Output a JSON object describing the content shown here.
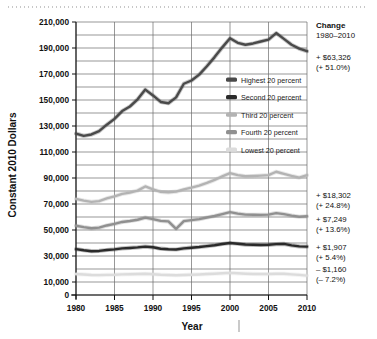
{
  "chart_data": {
    "type": "line",
    "title": "",
    "xlabel": "Year",
    "ylabel": "Constant 2010 Dollars",
    "xlim": [
      1980,
      2010
    ],
    "ylim": [
      0,
      210000
    ],
    "grid": true,
    "ytick_step": 20000,
    "ygrid_step": 10000,
    "xtick_step": 5,
    "legend_position": "inside-right-upper",
    "xticklabels": [
      "1980",
      "1985",
      "1990",
      "1995",
      "2000",
      "2005",
      "2010"
    ],
    "yticklabels": [
      "0",
      "10,000",
      "30,000",
      "50,000",
      "70,000",
      "90,000",
      "110,000",
      "130,000",
      "150,000",
      "170,000",
      "190,000",
      "210,000"
    ],
    "x": [
      1980,
      1981,
      1982,
      1983,
      1984,
      1985,
      1986,
      1987,
      1988,
      1989,
      1990,
      1991,
      1992,
      1993,
      1994,
      1995,
      1996,
      1997,
      1998,
      1999,
      2000,
      2001,
      2002,
      2003,
      2004,
      2005,
      2006,
      2007,
      2008,
      2009,
      2010
    ],
    "series": [
      {
        "name": "Highest 20 percent",
        "color": "#4a4a4a",
        "values": [
          124200,
          122400,
          123500,
          126000,
          131000,
          135500,
          141500,
          145000,
          150500,
          158000,
          153500,
          148500,
          147500,
          152000,
          162500,
          165000,
          169500,
          176000,
          183000,
          190500,
          197500,
          194000,
          192500,
          193500,
          195000,
          196500,
          201500,
          197000,
          192500,
          189500,
          187526
        ]
      },
      {
        "name": "Second 20 percent",
        "color": "#2a2a2a",
        "values": [
          35300,
          34400,
          33700,
          33900,
          34600,
          35100,
          35900,
          36200,
          36600,
          37200,
          36700,
          35600,
          35200,
          35000,
          35900,
          36400,
          36900,
          37600,
          38300,
          39200,
          40000,
          39400,
          38800,
          38600,
          38500,
          38600,
          39100,
          39300,
          38200,
          37400,
          37207
        ]
      },
      {
        "name": "Third 20 percent",
        "color": "#b3b3b3",
        "values": [
          73900,
          72600,
          71600,
          72200,
          74300,
          75800,
          77800,
          78800,
          80300,
          83500,
          81200,
          79400,
          79000,
          79500,
          81200,
          82600,
          84200,
          86200,
          88500,
          91300,
          93700,
          92200,
          91300,
          91500,
          91800,
          92200,
          94800,
          93200,
          91600,
          90300,
          92202
        ]
      },
      {
        "name": "Fourth 20 percent",
        "color": "#909090",
        "values": [
          53300,
          52200,
          51300,
          51800,
          53500,
          54700,
          56200,
          56900,
          57900,
          59500,
          58400,
          57000,
          56600,
          50900,
          56800,
          57600,
          58400,
          59600,
          60800,
          62200,
          63700,
          62600,
          61800,
          61700,
          61600,
          61800,
          63000,
          62200,
          61100,
          60200,
          60549
        ]
      },
      {
        "name": "Lowest 20 percent",
        "color": "#dcdcdc",
        "values": [
          16100,
          15800,
          15400,
          15300,
          15500,
          15600,
          15900,
          16000,
          16100,
          16300,
          16000,
          15600,
          15400,
          15200,
          15400,
          15600,
          15800,
          16100,
          16400,
          16700,
          17000,
          16700,
          16400,
          16200,
          16100,
          16100,
          16300,
          16300,
          15900,
          15500,
          14940
        ]
      }
    ]
  },
  "legend": {
    "items": [
      {
        "label": "Highest 20 percent",
        "color": "#4a4a4a"
      },
      {
        "label": "Second 20 percent",
        "color": "#2a2a2a"
      },
      {
        "label": "Third 20 percent",
        "color": "#b3b3b3"
      },
      {
        "label": "Fourth 20 percent",
        "color": "#909090"
      },
      {
        "label": "Lowest 20 percent",
        "color": "#dcdcdc"
      }
    ]
  },
  "annotations": {
    "header_title": "Change",
    "header_range": "1980–2010",
    "items": [
      {
        "amount": "+ $63,326",
        "percent": "(+ 51.0%)",
        "series": "Highest 20 percent"
      },
      {
        "amount": "+ $18,302",
        "percent": "(+ 24.8%)",
        "series": "Third 20 percent"
      },
      {
        "amount": "+ $7,249",
        "percent": "(+ 13.6%)",
        "series": "Fourth 20 percent"
      },
      {
        "amount": "+ $1,907",
        "percent": "(+ 5.4%)",
        "series": "Second 20 percent"
      },
      {
        "amount": "– $1,160",
        "percent": "(– 7.2%)",
        "series": "Lowest 20 percent"
      }
    ]
  },
  "axes": {
    "y_title": "Constant 2010 Dollars",
    "x_title": "Year"
  }
}
